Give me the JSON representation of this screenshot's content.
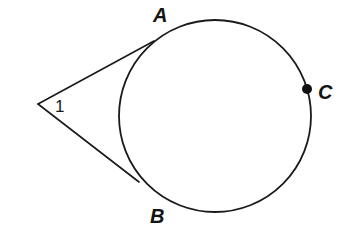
{
  "figure": {
    "background_color": "#ffffff",
    "stroke_color": "#1a1a1a",
    "width": 352,
    "height": 242
  },
  "circle": {
    "name": "circle",
    "center_x": 215,
    "center_y": 116,
    "radius": 96,
    "stroke_color": "#1a1a1a",
    "stroke_width": 1.8,
    "fill": "none"
  },
  "points": {
    "vertex": {
      "label": "1",
      "x": 38,
      "y": 104,
      "label_x": 55,
      "label_y": 112
    },
    "A": {
      "label": "A",
      "x": 154,
      "y": 41,
      "label_x": 153,
      "label_y": 22
    },
    "B": {
      "label": "B",
      "x": 139,
      "y": 182,
      "label_x": 150,
      "label_y": 223
    },
    "C": {
      "label": "C",
      "x": 307,
      "y": 89,
      "label_x": 318,
      "label_y": 99,
      "dot_radius": 5,
      "dot_fill": "#111111"
    }
  },
  "tangents": [
    {
      "name": "tangent-line-to-a",
      "x1": 38,
      "y1": 104,
      "x2": 154,
      "y2": 41,
      "stroke_width": 1.6
    },
    {
      "name": "tangent-line-to-b",
      "x1": 38,
      "y1": 104,
      "x2": 139,
      "y2": 182,
      "stroke_width": 1.6
    }
  ],
  "annotations": {
    "angle_number": "1"
  }
}
